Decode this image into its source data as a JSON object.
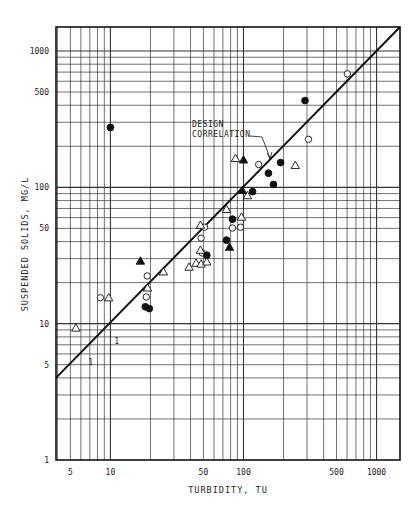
{
  "chart_data": {
    "type": "scatter",
    "title": "",
    "xlabel": "TURBIDITY, TU",
    "ylabel": "SUSPENDED SOLIDS, MG/L",
    "xscale": "log",
    "yscale": "log",
    "xlim": [
      3.9,
      1500
    ],
    "ylim": [
      1,
      1500
    ],
    "grid": true,
    "x_ticks": [
      5,
      10,
      50,
      100,
      500,
      1000
    ],
    "x_tick_labels": [
      "5",
      "10",
      "50",
      "100",
      "500",
      "1000"
    ],
    "y_ticks": [
      1,
      5,
      10,
      50,
      100,
      500,
      1000
    ],
    "y_tick_labels": [
      "1",
      "5",
      "10",
      "50",
      "100",
      "500",
      "1000"
    ],
    "legend": null,
    "annotations": [
      {
        "text_lines": [
          "DESIGN",
          "CORRELATION"
        ],
        "points_to": "design-correlation-line"
      },
      {
        "text": "1",
        "note": "slope indicator run"
      },
      {
        "text": "1",
        "note": "slope indicator rise"
      }
    ],
    "lines": [
      {
        "name": "Design Correlation",
        "x": [
          3.9,
          1500
        ],
        "y": [
          4.0,
          1500
        ],
        "style": "solid"
      }
    ],
    "series": [
      {
        "name": "open-circle",
        "marker": "circle-open",
        "points": [
          [
            8.4,
            15.5
          ],
          [
            18.9,
            22.4
          ],
          [
            18.6,
            15.7
          ],
          [
            49,
            33
          ],
          [
            48,
            42.4
          ],
          [
            51,
            51
          ],
          [
            82.6,
            50.3
          ],
          [
            95,
            51
          ],
          [
            130,
            147
          ],
          [
            308,
            225
          ],
          [
            603,
            680
          ]
        ]
      },
      {
        "name": "filled-circle",
        "marker": "circle-filled",
        "points": [
          [
            10,
            275
          ],
          [
            18.3,
            13.3
          ],
          [
            19.6,
            12.9
          ],
          [
            53,
            31.8
          ],
          [
            82.6,
            58.4
          ],
          [
            74.5,
            41
          ],
          [
            190,
            152
          ],
          [
            154,
            127
          ],
          [
            168,
            105
          ],
          [
            117,
            93
          ],
          [
            290,
            433
          ]
        ]
      },
      {
        "name": "open-triangle",
        "marker": "triangle-open",
        "points": [
          [
            5.5,
            9.3
          ],
          [
            9.7,
            15.5
          ],
          [
            25,
            24
          ],
          [
            19,
            18.3
          ],
          [
            39,
            26
          ],
          [
            44,
            27.8
          ],
          [
            48,
            27.4
          ],
          [
            53,
            28.4
          ],
          [
            47.5,
            34.6
          ],
          [
            47.5,
            52.8
          ],
          [
            74.5,
            69
          ],
          [
            96.5,
            60.5
          ],
          [
            87,
            163
          ],
          [
            245,
            145
          ],
          [
            107,
            87
          ]
        ]
      },
      {
        "name": "filled-triangle",
        "marker": "triangle-filled",
        "points": [
          [
            16.8,
            28.8
          ],
          [
            78.5,
            36.4
          ],
          [
            100,
            159
          ],
          [
            98,
            95
          ]
        ]
      }
    ]
  },
  "figure": {
    "plot_box": {
      "left": 56,
      "top": 27,
      "right": 400,
      "bottom": 460
    },
    "colors": {
      "ink": "#111111",
      "grid": "#333333",
      "background": "#ffffff"
    }
  }
}
